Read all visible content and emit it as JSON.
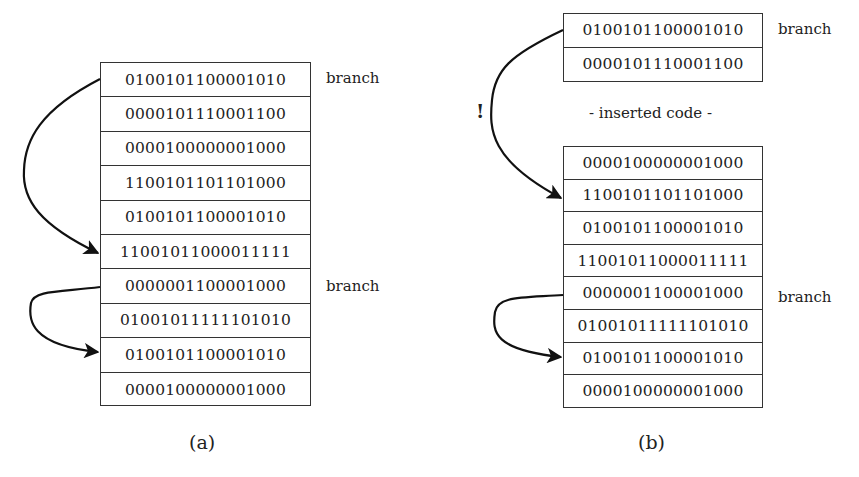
{
  "panel_a": {
    "caption": "(a)",
    "rows": [
      "0100101100001010",
      "0000101110001100",
      "0000100000001000",
      "1100101101101000",
      "0100101100001010",
      "11001011000011111",
      "0000001100001000",
      "01001011111101010",
      "0100101100001010",
      "0000100000001000"
    ],
    "branch_labels": [
      "branch",
      "branch"
    ]
  },
  "panel_b": {
    "caption": "(b)",
    "top_rows": [
      "0100101100001010",
      "0000101110001100"
    ],
    "inserted_label": "- inserted code -",
    "bottom_rows": [
      "0000100000001000",
      "1100101101101000",
      "0100101100001010",
      "11001011000011111",
      "0000001100001000",
      "01001011111101010",
      "0100101100001010",
      "0000100000001000"
    ],
    "branch_labels": [
      "branch",
      "branch"
    ],
    "broken_jump_mark": "!"
  }
}
